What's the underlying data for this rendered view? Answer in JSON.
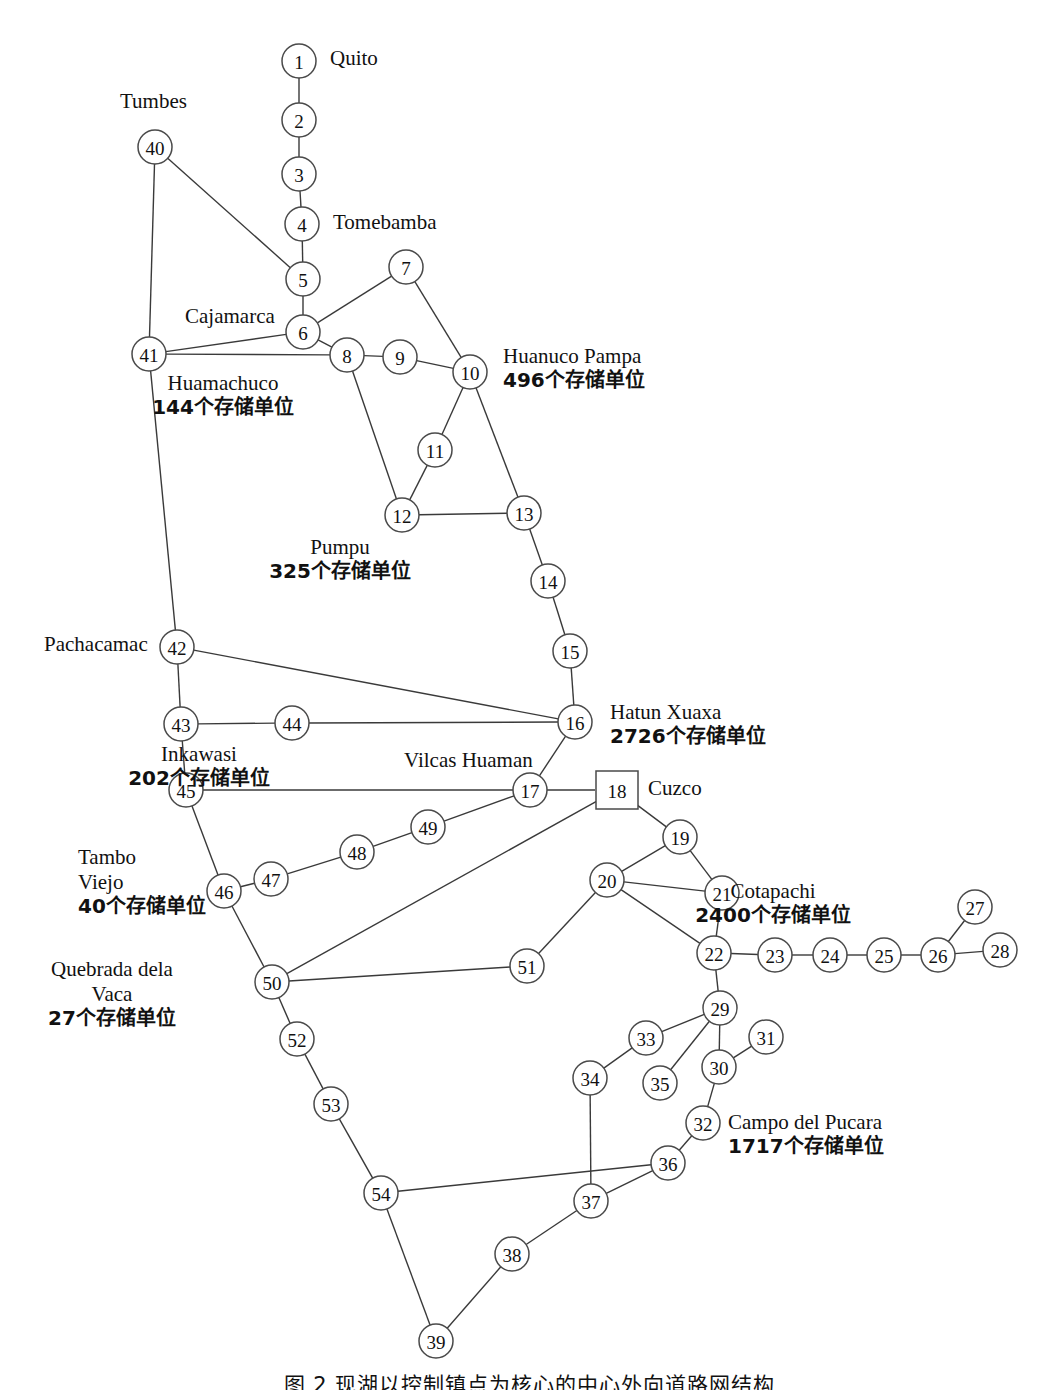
{
  "figure": {
    "type": "node-link-network-diagram",
    "caption": "图 2  现湖以控制镇点为核心的中心外向道路网结构"
  },
  "graph_data": {
    "type": "graph",
    "node_count": 54,
    "nodes": [
      {
        "id": "1",
        "x": 299,
        "y": 61,
        "shape": "circle"
      },
      {
        "id": "2",
        "x": 299,
        "y": 120,
        "shape": "circle"
      },
      {
        "id": "3",
        "x": 299,
        "y": 174,
        "shape": "circle"
      },
      {
        "id": "4",
        "x": 302,
        "y": 224,
        "shape": "circle"
      },
      {
        "id": "5",
        "x": 303,
        "y": 279,
        "shape": "circle"
      },
      {
        "id": "6",
        "x": 303,
        "y": 332,
        "shape": "circle"
      },
      {
        "id": "7",
        "x": 406,
        "y": 267,
        "shape": "circle"
      },
      {
        "id": "8",
        "x": 347,
        "y": 355,
        "shape": "circle"
      },
      {
        "id": "9",
        "x": 400,
        "y": 357,
        "shape": "circle"
      },
      {
        "id": "10",
        "x": 470,
        "y": 372,
        "shape": "circle"
      },
      {
        "id": "11",
        "x": 435,
        "y": 450,
        "shape": "circle"
      },
      {
        "id": "12",
        "x": 402,
        "y": 515,
        "shape": "circle"
      },
      {
        "id": "13",
        "x": 524,
        "y": 513,
        "shape": "circle"
      },
      {
        "id": "14",
        "x": 548,
        "y": 581,
        "shape": "circle"
      },
      {
        "id": "15",
        "x": 570,
        "y": 651,
        "shape": "circle"
      },
      {
        "id": "16",
        "x": 575,
        "y": 722,
        "shape": "circle"
      },
      {
        "id": "17",
        "x": 530,
        "y": 790,
        "shape": "circle"
      },
      {
        "id": "18",
        "x": 617,
        "y": 790,
        "shape": "square"
      },
      {
        "id": "19",
        "x": 680,
        "y": 837,
        "shape": "circle"
      },
      {
        "id": "20",
        "x": 607,
        "y": 880,
        "shape": "circle"
      },
      {
        "id": "21",
        "x": 722,
        "y": 893,
        "shape": "circle"
      },
      {
        "id": "22",
        "x": 714,
        "y": 953,
        "shape": "circle"
      },
      {
        "id": "23",
        "x": 775,
        "y": 955,
        "shape": "circle"
      },
      {
        "id": "24",
        "x": 830,
        "y": 955,
        "shape": "circle"
      },
      {
        "id": "25",
        "x": 884,
        "y": 955,
        "shape": "circle"
      },
      {
        "id": "26",
        "x": 938,
        "y": 955,
        "shape": "circle"
      },
      {
        "id": "27",
        "x": 975,
        "y": 907,
        "shape": "circle"
      },
      {
        "id": "28",
        "x": 1000,
        "y": 950,
        "shape": "circle"
      },
      {
        "id": "29",
        "x": 720,
        "y": 1008,
        "shape": "circle"
      },
      {
        "id": "30",
        "x": 719,
        "y": 1067,
        "shape": "circle"
      },
      {
        "id": "31",
        "x": 766,
        "y": 1037,
        "shape": "circle"
      },
      {
        "id": "32",
        "x": 703,
        "y": 1123,
        "shape": "circle"
      },
      {
        "id": "33",
        "x": 646,
        "y": 1038,
        "shape": "circle"
      },
      {
        "id": "34",
        "x": 590,
        "y": 1078,
        "shape": "circle"
      },
      {
        "id": "35",
        "x": 660,
        "y": 1083,
        "shape": "circle"
      },
      {
        "id": "36",
        "x": 668,
        "y": 1163,
        "shape": "circle"
      },
      {
        "id": "37",
        "x": 591,
        "y": 1201,
        "shape": "circle"
      },
      {
        "id": "38",
        "x": 512,
        "y": 1254,
        "shape": "circle"
      },
      {
        "id": "39",
        "x": 436,
        "y": 1341,
        "shape": "circle"
      },
      {
        "id": "40",
        "x": 155,
        "y": 147,
        "shape": "circle"
      },
      {
        "id": "41",
        "x": 149,
        "y": 354,
        "shape": "circle"
      },
      {
        "id": "42",
        "x": 177,
        "y": 647,
        "shape": "circle"
      },
      {
        "id": "43",
        "x": 181,
        "y": 724,
        "shape": "circle"
      },
      {
        "id": "44",
        "x": 292,
        "y": 723,
        "shape": "circle"
      },
      {
        "id": "45",
        "x": 186,
        "y": 790,
        "shape": "circle"
      },
      {
        "id": "46",
        "x": 224,
        "y": 891,
        "shape": "circle"
      },
      {
        "id": "47",
        "x": 271,
        "y": 879,
        "shape": "circle"
      },
      {
        "id": "48",
        "x": 357,
        "y": 852,
        "shape": "circle"
      },
      {
        "id": "49",
        "x": 428,
        "y": 827,
        "shape": "circle"
      },
      {
        "id": "50",
        "x": 272,
        "y": 982,
        "shape": "circle"
      },
      {
        "id": "51",
        "x": 527,
        "y": 966,
        "shape": "circle"
      },
      {
        "id": "52",
        "x": 297,
        "y": 1039,
        "shape": "circle"
      },
      {
        "id": "53",
        "x": 331,
        "y": 1104,
        "shape": "circle"
      },
      {
        "id": "54",
        "x": 381,
        "y": 1193,
        "shape": "circle"
      }
    ],
    "edges": [
      [
        "1",
        "2"
      ],
      [
        "2",
        "3"
      ],
      [
        "3",
        "4"
      ],
      [
        "4",
        "5"
      ],
      [
        "5",
        "6"
      ],
      [
        "5",
        "40"
      ],
      [
        "6",
        "7"
      ],
      [
        "6",
        "8"
      ],
      [
        "6",
        "41"
      ],
      [
        "7",
        "10"
      ],
      [
        "8",
        "9"
      ],
      [
        "8",
        "41"
      ],
      [
        "8",
        "12"
      ],
      [
        "9",
        "10"
      ],
      [
        "10",
        "11"
      ],
      [
        "10",
        "13"
      ],
      [
        "11",
        "12"
      ],
      [
        "12",
        "13"
      ],
      [
        "13",
        "14"
      ],
      [
        "14",
        "15"
      ],
      [
        "15",
        "16"
      ],
      [
        "16",
        "42"
      ],
      [
        "16",
        "44"
      ],
      [
        "16",
        "17"
      ],
      [
        "17",
        "45"
      ],
      [
        "17",
        "49"
      ],
      [
        "17",
        "18"
      ],
      [
        "18",
        "19"
      ],
      [
        "18",
        "50"
      ],
      [
        "19",
        "20"
      ],
      [
        "19",
        "21"
      ],
      [
        "20",
        "21"
      ],
      [
        "20",
        "22"
      ],
      [
        "20",
        "51"
      ],
      [
        "21",
        "22"
      ],
      [
        "22",
        "23"
      ],
      [
        "22",
        "29"
      ],
      [
        "23",
        "24"
      ],
      [
        "24",
        "25"
      ],
      [
        "25",
        "26"
      ],
      [
        "26",
        "27"
      ],
      [
        "26",
        "28"
      ],
      [
        "29",
        "30"
      ],
      [
        "29",
        "33"
      ],
      [
        "29",
        "35"
      ],
      [
        "30",
        "31"
      ],
      [
        "30",
        "32"
      ],
      [
        "32",
        "36"
      ],
      [
        "33",
        "34"
      ],
      [
        "34",
        "37"
      ],
      [
        "36",
        "37"
      ],
      [
        "36",
        "54"
      ],
      [
        "37",
        "38"
      ],
      [
        "38",
        "39"
      ],
      [
        "39",
        "54"
      ],
      [
        "40",
        "41"
      ],
      [
        "41",
        "42"
      ],
      [
        "42",
        "43"
      ],
      [
        "43",
        "44"
      ],
      [
        "43",
        "45"
      ],
      [
        "45",
        "46"
      ],
      [
        "46",
        "47"
      ],
      [
        "46",
        "50"
      ],
      [
        "47",
        "48"
      ],
      [
        "48",
        "49"
      ],
      [
        "50",
        "51"
      ],
      [
        "50",
        "52"
      ],
      [
        "52",
        "53"
      ],
      [
        "53",
        "54"
      ]
    ],
    "place_labels": [
      {
        "key": "quito",
        "name": "Quito",
        "storage": "",
        "node": "1",
        "x": 330,
        "y": 46,
        "align": "left"
      },
      {
        "key": "tumbes",
        "name": "Tumbes",
        "storage": "",
        "node": "40",
        "x": 120,
        "y": 89,
        "align": "left"
      },
      {
        "key": "tomebamba",
        "name": "Tomebamba",
        "storage": "",
        "node": "4",
        "x": 333,
        "y": 210,
        "align": "left"
      },
      {
        "key": "cajamarca",
        "name": "Cajamarca",
        "storage": "",
        "node": "6",
        "x": 185,
        "y": 304,
        "align": "left"
      },
      {
        "key": "huamachuco",
        "name": "Huamachuco",
        "storage": "144个存储单位",
        "node": "8",
        "x": 223,
        "y": 371,
        "align": "center"
      },
      {
        "key": "huanuco",
        "name": "Huanuco Pampa",
        "storage": "496个存储单位",
        "node": "10",
        "x": 503,
        "y": 344,
        "align": "left"
      },
      {
        "key": "pumpu",
        "name": "Pumpu",
        "storage": "325个存储单位",
        "node": "12",
        "x": 340,
        "y": 535,
        "align": "center"
      },
      {
        "key": "pachacamac",
        "name": "Pachacamac",
        "storage": "",
        "node": "42",
        "x": 44,
        "y": 632,
        "align": "left"
      },
      {
        "key": "hatunxuaxa",
        "name": "Hatun Xuaxa",
        "storage": "2726个存储单位",
        "node": "16",
        "x": 610,
        "y": 700,
        "align": "left"
      },
      {
        "key": "inkawasi",
        "name": "Inkawasi",
        "storage": "202个存储单位",
        "node": "44",
        "x": 199,
        "y": 742,
        "align": "center"
      },
      {
        "key": "vilcashuaman",
        "name": "Vilcas Huaman",
        "storage": "",
        "node": "17",
        "x": 404,
        "y": 748,
        "align": "left"
      },
      {
        "key": "cuzco",
        "name": "Cuzco",
        "storage": "",
        "node": "18",
        "x": 648,
        "y": 776,
        "align": "left"
      },
      {
        "key": "cotapachi",
        "name": "Cotapachi",
        "storage": "2400个存储单位",
        "node": "26",
        "x": 773,
        "y": 879,
        "align": "center"
      },
      {
        "key": "tambovi",
        "name": "Tambo\nViejo",
        "storage": "40个存储单位",
        "node": "46",
        "x": 78,
        "y": 845,
        "align": "left"
      },
      {
        "key": "quebrada",
        "name": "Quebrada dela\nVaca",
        "storage": "27个存储单位",
        "node": "50",
        "x": 112,
        "y": 957,
        "align": "center"
      },
      {
        "key": "campopucara",
        "name": "Campo del Pucara",
        "storage": "1717个存储单位",
        "node": "32",
        "x": 728,
        "y": 1110,
        "align": "left"
      }
    ]
  }
}
